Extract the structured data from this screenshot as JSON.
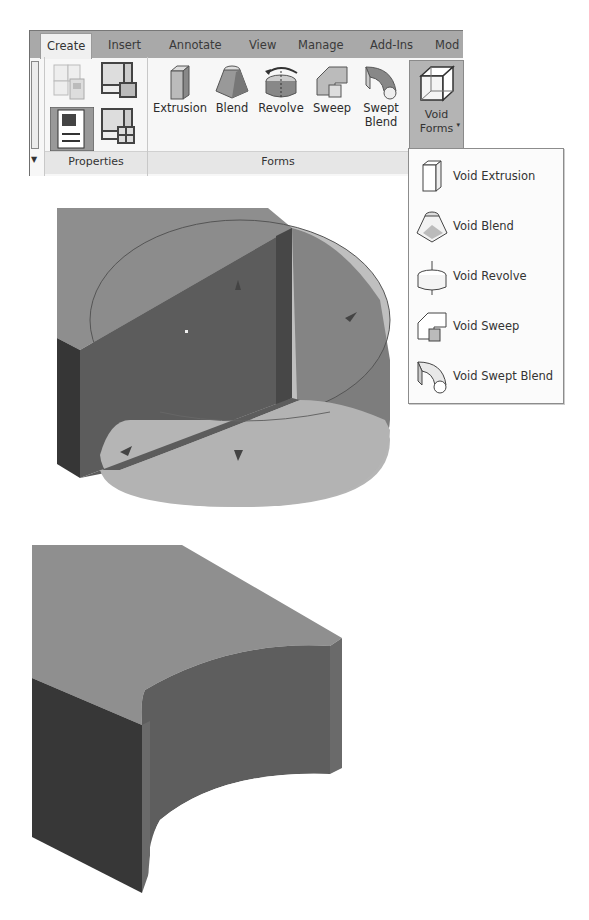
{
  "ribbon": {
    "tabs": [
      {
        "label": "Create",
        "active": true
      },
      {
        "label": "Insert",
        "active": false
      },
      {
        "label": "Annotate",
        "active": false
      },
      {
        "label": "View",
        "active": false
      },
      {
        "label": "Manage",
        "active": false
      },
      {
        "label": "Add-Ins",
        "active": false
      },
      {
        "label": "Mod",
        "active": false
      }
    ],
    "panels": {
      "properties": {
        "label": "Properties"
      },
      "forms": {
        "label": "Forms",
        "tools": [
          {
            "label": "Extrusion",
            "icon": "extrusion-icon"
          },
          {
            "label": "Blend",
            "icon": "blend-icon"
          },
          {
            "label": "Revolve",
            "icon": "revolve-icon"
          },
          {
            "label": "Sweep",
            "icon": "sweep-icon"
          },
          {
            "label_line1": "Swept",
            "label_line2": "Blend",
            "icon": "swept-blend-icon"
          }
        ]
      },
      "void_forms": {
        "label_line1": "Void",
        "label_line2": "Forms",
        "icon": "void-forms-icon",
        "caret": "▾"
      }
    }
  },
  "void_forms_menu": {
    "items": [
      {
        "label": "Void Extrusion",
        "icon": "void-extrusion-icon"
      },
      {
        "label": "Void Blend",
        "icon": "void-blend-icon"
      },
      {
        "label": "Void Revolve",
        "icon": "void-revolve-icon"
      },
      {
        "label": "Void Sweep",
        "icon": "void-sweep-icon"
      },
      {
        "label": "Void Swept Blend",
        "icon": "void-swept-blend-icon"
      }
    ]
  },
  "viewport": {
    "colors": {
      "top_face": "#8e8e8e",
      "front_face_dark": "#4a4a4a",
      "side_face": "#696969",
      "void_cylinder": "#a6a6a6",
      "void_cylinder_side": "#7d7d7d",
      "void_bottom": "#b7b7b7"
    }
  }
}
